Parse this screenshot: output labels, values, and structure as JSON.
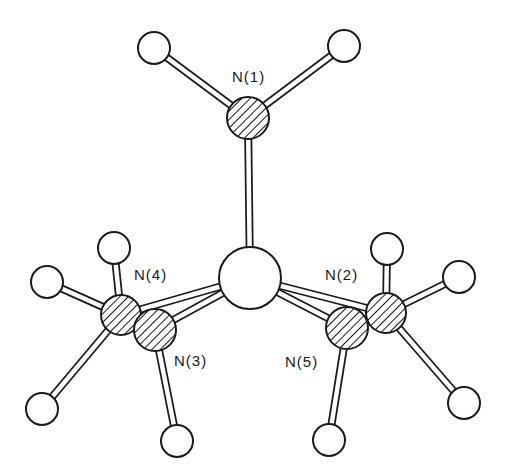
{
  "diagram": {
    "type": "ball-and-stick molecular structure",
    "colors": {
      "background": "#ffffff",
      "line": "#1a1a1a",
      "atom_fill": "#ffffff"
    },
    "atoms": [
      {
        "id": "M",
        "kind": "metal",
        "hatched": false,
        "label": ""
      },
      {
        "id": "N1",
        "kind": "nitrogen",
        "hatched": true,
        "label": "N(1)"
      },
      {
        "id": "N2",
        "kind": "nitrogen",
        "hatched": true,
        "label": "N(2)"
      },
      {
        "id": "N3",
        "kind": "nitrogen",
        "hatched": true,
        "label": "N(3)"
      },
      {
        "id": "N4",
        "kind": "nitrogen",
        "hatched": true,
        "label": "N(4)"
      },
      {
        "id": "N5",
        "kind": "nitrogen",
        "hatched": true,
        "label": "N(5)"
      },
      {
        "id": "H1a",
        "kind": "hydrogen",
        "hatched": false,
        "label": ""
      },
      {
        "id": "H1b",
        "kind": "hydrogen",
        "hatched": false,
        "label": ""
      },
      {
        "id": "H4a",
        "kind": "hydrogen",
        "hatched": false,
        "label": ""
      },
      {
        "id": "H4b",
        "kind": "hydrogen",
        "hatched": false,
        "label": ""
      },
      {
        "id": "H4c",
        "kind": "hydrogen",
        "hatched": false,
        "label": ""
      },
      {
        "id": "H3a",
        "kind": "hydrogen",
        "hatched": false,
        "label": ""
      },
      {
        "id": "H2a",
        "kind": "hydrogen",
        "hatched": false,
        "label": ""
      },
      {
        "id": "H2b",
        "kind": "hydrogen",
        "hatched": false,
        "label": ""
      },
      {
        "id": "H2c",
        "kind": "hydrogen",
        "hatched": false,
        "label": ""
      },
      {
        "id": "H5a",
        "kind": "hydrogen",
        "hatched": false,
        "label": ""
      }
    ],
    "bonds": [
      [
        "N1",
        "H1a"
      ],
      [
        "N1",
        "H1b"
      ],
      [
        "N1",
        "M"
      ],
      [
        "M",
        "N4"
      ],
      [
        "M",
        "N3"
      ],
      [
        "M",
        "N2"
      ],
      [
        "M",
        "N5"
      ],
      [
        "N4",
        "H4a"
      ],
      [
        "N4",
        "H4b"
      ],
      [
        "N4",
        "H4c"
      ],
      [
        "N3",
        "H3a"
      ],
      [
        "N2",
        "H2a"
      ],
      [
        "N2",
        "H2b"
      ],
      [
        "N2",
        "H2c"
      ],
      [
        "N5",
        "H5a"
      ]
    ],
    "labels": {
      "n1": "N(1)",
      "n2": "N(2)",
      "n3": "N(3)",
      "n4": "N(4)",
      "n5": "N(5)"
    }
  }
}
